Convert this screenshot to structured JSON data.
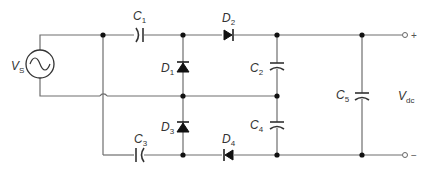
{
  "diagram": {
    "type": "voltage-quadrupler circuit",
    "source": {
      "label": "V",
      "sub": "S"
    },
    "capacitors": [
      {
        "id": "C1",
        "label": "C",
        "sub": "1"
      },
      {
        "id": "C2",
        "label": "C",
        "sub": "2"
      },
      {
        "id": "C3",
        "label": "C",
        "sub": "3"
      },
      {
        "id": "C4",
        "label": "C",
        "sub": "4"
      },
      {
        "id": "C5",
        "label": "C",
        "sub": "5"
      }
    ],
    "diodes": [
      {
        "id": "D1",
        "label": "D",
        "sub": "1"
      },
      {
        "id": "D2",
        "label": "D",
        "sub": "2"
      },
      {
        "id": "D3",
        "label": "D",
        "sub": "3"
      },
      {
        "id": "D4",
        "label": "D",
        "sub": "4"
      }
    ],
    "output": {
      "label": "V",
      "sub": "dc",
      "plus": "+",
      "minus": "−"
    },
    "colors": {
      "wire": "#6e6e6e",
      "component": "#111111"
    }
  }
}
